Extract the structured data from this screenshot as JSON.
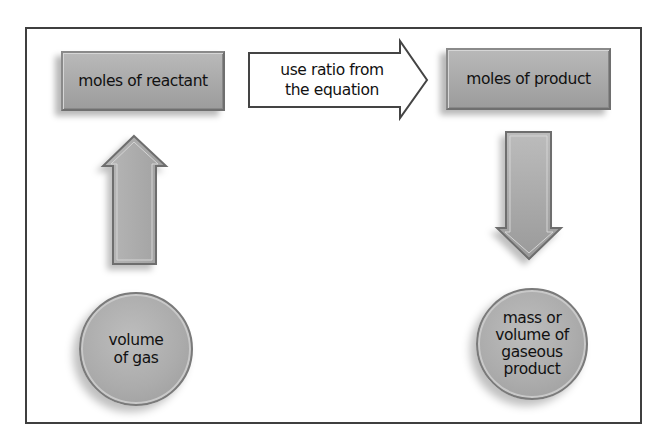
{
  "diagram": {
    "reactant_box": {
      "label": "moles of reactant"
    },
    "ratio_arrow": {
      "line1": "use ratio from",
      "line2": "the equation"
    },
    "product_box": {
      "label": "moles of product"
    },
    "gas_circle": {
      "line1": "volume",
      "line2": "of gas"
    },
    "product_circle": {
      "line1": "mass or",
      "line2": "volume of",
      "line3": "gaseous",
      "line4": "product"
    },
    "colors": {
      "frame": "#3f3f3f",
      "box_fill": "#aaaaaa",
      "arrow_fill": "#a8a8a8",
      "text": "#111111",
      "background": "#ffffff"
    }
  }
}
